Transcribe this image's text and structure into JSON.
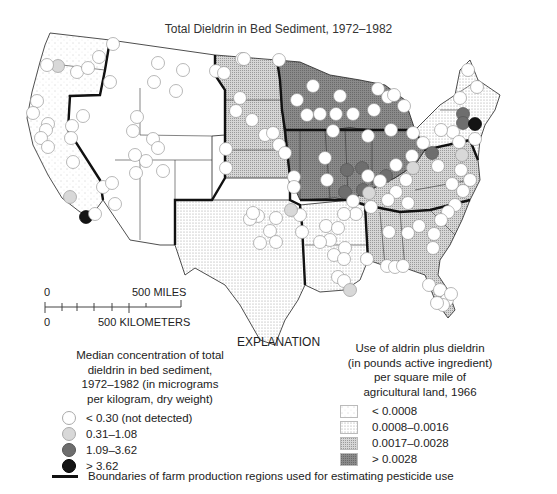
{
  "title": "Total Dieldrin in Bed Sediment, 1972–1982",
  "scale_bar": {
    "miles_zero": "0",
    "miles_label": "500 MILES",
    "km_zero": "0",
    "km_label": "500 KILOMETERS"
  },
  "explanation_heading": "EXPLANATION",
  "concentration_legend": {
    "header_lines": [
      "Median concentration of total",
      "dieldrin in bed sediment,",
      "1972–1982 (in micrograms",
      "per kilogram, dry weight)"
    ],
    "items": [
      {
        "label": "< 0.30 (not detected)",
        "color": "#ffffff"
      },
      {
        "label": "0.31–1.08",
        "color": "#d8d8d8"
      },
      {
        "label": "1.09–3.62",
        "color": "#6e6e6e"
      },
      {
        "label": "> 3.62",
        "color": "#141414"
      }
    ]
  },
  "use_legend": {
    "header_lines": [
      "Use of aldrin plus dieldrin",
      "(in pounds active ingredient)",
      "per square mile of",
      "agricultural land, 1966"
    ],
    "items": [
      {
        "label": "< 0.0008",
        "pattern": "sparse-dots",
        "color": "#f6f6f6"
      },
      {
        "label": "0.0008–0.0016",
        "pattern": "dots",
        "color": "#e6e6e6"
      },
      {
        "label": "0.0017–0.0028",
        "pattern": "dense-dots",
        "color": "#bdbdbd"
      },
      {
        "label": "> 0.0028",
        "pattern": "grid",
        "color": "#7a7a7a"
      }
    ]
  },
  "boundary_legend": {
    "label": "Boundaries of farm production regions used for estimating pesticide use",
    "color": "#111111"
  },
  "map": {
    "regions": [
      {
        "name": "pacific",
        "shade": 0
      },
      {
        "name": "mountain",
        "shade": 0
      },
      {
        "name": "northern-plains",
        "shade": 2
      },
      {
        "name": "southern-plains",
        "shade": 1
      },
      {
        "name": "lake-states",
        "shade": 3
      },
      {
        "name": "corn-belt",
        "shade": 3
      },
      {
        "name": "delta",
        "shade": 1
      },
      {
        "name": "appalachian",
        "shade": 2
      },
      {
        "name": "southeast",
        "shade": 2
      },
      {
        "name": "northeast",
        "shade": 1
      }
    ],
    "sites": [
      {
        "x": 113,
        "y": 44,
        "c": 0
      },
      {
        "x": 99,
        "y": 57,
        "c": 0
      },
      {
        "x": 58,
        "y": 66,
        "c": 1
      },
      {
        "x": 47,
        "y": 65,
        "c": 0
      },
      {
        "x": 77,
        "y": 72,
        "c": 0
      },
      {
        "x": 88,
        "y": 68,
        "c": 0
      },
      {
        "x": 110,
        "y": 82,
        "c": 0
      },
      {
        "x": 37,
        "y": 101,
        "c": 0
      },
      {
        "x": 33,
        "y": 113,
        "c": 0
      },
      {
        "x": 158,
        "y": 63,
        "c": 0
      },
      {
        "x": 183,
        "y": 70,
        "c": 0
      },
      {
        "x": 154,
        "y": 82,
        "c": 0
      },
      {
        "x": 176,
        "y": 91,
        "c": 0
      },
      {
        "x": 242,
        "y": 59,
        "c": 0
      },
      {
        "x": 216,
        "y": 71,
        "c": 0
      },
      {
        "x": 224,
        "y": 73,
        "c": 0
      },
      {
        "x": 240,
        "y": 98,
        "c": 0
      },
      {
        "x": 236,
        "y": 111,
        "c": 0
      },
      {
        "x": 252,
        "y": 120,
        "c": 0
      },
      {
        "x": 265,
        "y": 135,
        "c": 0
      },
      {
        "x": 273,
        "y": 133,
        "c": 0
      },
      {
        "x": 279,
        "y": 145,
        "c": 0
      },
      {
        "x": 285,
        "y": 153,
        "c": 0
      },
      {
        "x": 226,
        "y": 149,
        "c": 0
      },
      {
        "x": 226,
        "y": 168,
        "c": 0
      },
      {
        "x": 294,
        "y": 177,
        "c": 0
      },
      {
        "x": 294,
        "y": 187,
        "c": 0
      },
      {
        "x": 244,
        "y": 59,
        "c": 0
      },
      {
        "x": 279,
        "y": 60,
        "c": 0
      },
      {
        "x": 313,
        "y": 86,
        "c": 0
      },
      {
        "x": 297,
        "y": 100,
        "c": 0
      },
      {
        "x": 307,
        "y": 115,
        "c": 0
      },
      {
        "x": 320,
        "y": 114,
        "c": 0
      },
      {
        "x": 336,
        "y": 114,
        "c": 0
      },
      {
        "x": 353,
        "y": 114,
        "c": 0
      },
      {
        "x": 340,
        "y": 96,
        "c": 0
      },
      {
        "x": 378,
        "y": 89,
        "c": 0
      },
      {
        "x": 388,
        "y": 97,
        "c": 0
      },
      {
        "x": 374,
        "y": 110,
        "c": 0
      },
      {
        "x": 394,
        "y": 95,
        "c": 0
      },
      {
        "x": 404,
        "y": 106,
        "c": 0
      },
      {
        "x": 333,
        "y": 131,
        "c": 0
      },
      {
        "x": 368,
        "y": 136,
        "c": 0
      },
      {
        "x": 391,
        "y": 130,
        "c": 0
      },
      {
        "x": 413,
        "y": 133,
        "c": 0
      },
      {
        "x": 325,
        "y": 158,
        "c": 0
      },
      {
        "x": 327,
        "y": 180,
        "c": 0
      },
      {
        "x": 347,
        "y": 170,
        "c": 2
      },
      {
        "x": 362,
        "y": 168,
        "c": 2
      },
      {
        "x": 386,
        "y": 176,
        "c": 2
      },
      {
        "x": 363,
        "y": 190,
        "c": 2
      },
      {
        "x": 345,
        "y": 192,
        "c": 2
      },
      {
        "x": 368,
        "y": 176,
        "c": 0
      },
      {
        "x": 380,
        "y": 181,
        "c": 0
      },
      {
        "x": 396,
        "y": 165,
        "c": 0
      },
      {
        "x": 412,
        "y": 156,
        "c": 0
      },
      {
        "x": 413,
        "y": 168,
        "c": 1
      },
      {
        "x": 423,
        "y": 143,
        "c": 0
      },
      {
        "x": 432,
        "y": 153,
        "c": 2
      },
      {
        "x": 438,
        "y": 166,
        "c": 0
      },
      {
        "x": 453,
        "y": 132,
        "c": 0
      },
      {
        "x": 463,
        "y": 114,
        "c": 2
      },
      {
        "x": 463,
        "y": 123,
        "c": 2
      },
      {
        "x": 475,
        "y": 124,
        "c": 3
      },
      {
        "x": 459,
        "y": 142,
        "c": 0
      },
      {
        "x": 475,
        "y": 139,
        "c": 0
      },
      {
        "x": 462,
        "y": 155,
        "c": 1
      },
      {
        "x": 461,
        "y": 170,
        "c": 0
      },
      {
        "x": 470,
        "y": 180,
        "c": 0
      },
      {
        "x": 463,
        "y": 191,
        "c": 0
      },
      {
        "x": 455,
        "y": 205,
        "c": 0
      },
      {
        "x": 448,
        "y": 212,
        "c": 0
      },
      {
        "x": 441,
        "y": 220,
        "c": 0
      },
      {
        "x": 434,
        "y": 234,
        "c": 0
      },
      {
        "x": 452,
        "y": 184,
        "c": 0
      },
      {
        "x": 468,
        "y": 70,
        "c": 0
      },
      {
        "x": 477,
        "y": 87,
        "c": 0
      },
      {
        "x": 460,
        "y": 98,
        "c": 0
      },
      {
        "x": 441,
        "y": 130,
        "c": 0
      },
      {
        "x": 406,
        "y": 180,
        "c": 0
      },
      {
        "x": 396,
        "y": 192,
        "c": 0
      },
      {
        "x": 408,
        "y": 203,
        "c": 0
      },
      {
        "x": 388,
        "y": 200,
        "c": 0
      },
      {
        "x": 371,
        "y": 207,
        "c": 0
      },
      {
        "x": 356,
        "y": 214,
        "c": 0
      },
      {
        "x": 344,
        "y": 214,
        "c": 0
      },
      {
        "x": 353,
        "y": 201,
        "c": 0
      },
      {
        "x": 369,
        "y": 193,
        "c": 1
      },
      {
        "x": 389,
        "y": 232,
        "c": 0
      },
      {
        "x": 408,
        "y": 233,
        "c": 0
      },
      {
        "x": 300,
        "y": 215,
        "c": 0
      },
      {
        "x": 276,
        "y": 218,
        "c": 0
      },
      {
        "x": 258,
        "y": 216,
        "c": 0
      },
      {
        "x": 250,
        "y": 219,
        "c": 0
      },
      {
        "x": 253,
        "y": 213,
        "c": 0
      },
      {
        "x": 291,
        "y": 210,
        "c": 1
      },
      {
        "x": 270,
        "y": 231,
        "c": 0
      },
      {
        "x": 260,
        "y": 243,
        "c": 0
      },
      {
        "x": 276,
        "y": 242,
        "c": 0
      },
      {
        "x": 302,
        "y": 232,
        "c": 0
      },
      {
        "x": 326,
        "y": 226,
        "c": 0
      },
      {
        "x": 338,
        "y": 228,
        "c": 0
      },
      {
        "x": 330,
        "y": 240,
        "c": 0
      },
      {
        "x": 320,
        "y": 242,
        "c": 0
      },
      {
        "x": 334,
        "y": 255,
        "c": 0
      },
      {
        "x": 345,
        "y": 248,
        "c": 0
      },
      {
        "x": 344,
        "y": 259,
        "c": 0
      },
      {
        "x": 338,
        "y": 277,
        "c": 0
      },
      {
        "x": 344,
        "y": 281,
        "c": 0
      },
      {
        "x": 350,
        "y": 290,
        "c": 1
      },
      {
        "x": 367,
        "y": 259,
        "c": 0
      },
      {
        "x": 387,
        "y": 266,
        "c": 0
      },
      {
        "x": 395,
        "y": 267,
        "c": 0
      },
      {
        "x": 403,
        "y": 266,
        "c": 0
      },
      {
        "x": 419,
        "y": 226,
        "c": 0
      },
      {
        "x": 433,
        "y": 248,
        "c": 0
      },
      {
        "x": 429,
        "y": 285,
        "c": 0
      },
      {
        "x": 440,
        "y": 290,
        "c": 0
      },
      {
        "x": 447,
        "y": 300,
        "c": 0
      },
      {
        "x": 443,
        "y": 305,
        "c": 0
      },
      {
        "x": 451,
        "y": 294,
        "c": 0
      },
      {
        "x": 437,
        "y": 303,
        "c": 0
      },
      {
        "x": 48,
        "y": 124,
        "c": 0
      },
      {
        "x": 83,
        "y": 116,
        "c": 0
      },
      {
        "x": 72,
        "y": 126,
        "c": 0
      },
      {
        "x": 71,
        "y": 138,
        "c": 0
      },
      {
        "x": 46,
        "y": 130,
        "c": 0
      },
      {
        "x": 41,
        "y": 138,
        "c": 0
      },
      {
        "x": 48,
        "y": 147,
        "c": 0
      },
      {
        "x": 73,
        "y": 162,
        "c": 0
      },
      {
        "x": 137,
        "y": 117,
        "c": 0
      },
      {
        "x": 133,
        "y": 131,
        "c": 0
      },
      {
        "x": 153,
        "y": 139,
        "c": 0
      },
      {
        "x": 158,
        "y": 148,
        "c": 0
      },
      {
        "x": 163,
        "y": 171,
        "c": 0
      },
      {
        "x": 136,
        "y": 173,
        "c": 0
      },
      {
        "x": 146,
        "y": 161,
        "c": 0
      },
      {
        "x": 135,
        "y": 155,
        "c": 0
      },
      {
        "x": 103,
        "y": 187,
        "c": 0
      },
      {
        "x": 115,
        "y": 204,
        "c": 0
      },
      {
        "x": 70,
        "y": 197,
        "c": 1
      },
      {
        "x": 86,
        "y": 217,
        "c": 3
      },
      {
        "x": 95,
        "y": 214,
        "c": 0
      },
      {
        "x": 112,
        "y": 183,
        "c": 0
      }
    ]
  }
}
